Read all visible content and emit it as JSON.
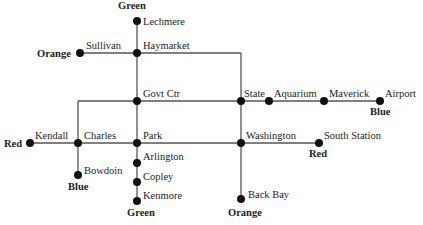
{
  "diagram": {
    "type": "subway-map",
    "colors": {
      "background": "#ffffff",
      "line": "#555555",
      "stop": "#111111",
      "text": "#222222"
    },
    "line_end_labels": [
      {
        "id": "green-north",
        "text": "Green",
        "x": 118,
        "y": 9
      },
      {
        "id": "orange-north",
        "text": "Orange",
        "x": 37,
        "y": 57
      },
      {
        "id": "blue-east",
        "text": "Blue",
        "x": 370,
        "y": 115
      },
      {
        "id": "red-west",
        "text": "Red",
        "x": 4,
        "y": 147
      },
      {
        "id": "red-east",
        "text": "Red",
        "x": 309,
        "y": 157
      },
      {
        "id": "blue-west",
        "text": "Blue",
        "x": 68,
        "y": 190
      },
      {
        "id": "green-south",
        "text": "Green",
        "x": 127,
        "y": 216
      },
      {
        "id": "orange-south",
        "text": "Orange",
        "x": 228,
        "y": 216
      }
    ],
    "stations": [
      {
        "id": "lechmere",
        "name": "Lechmere",
        "x": 137,
        "y": 21,
        "lx": 143,
        "ly": 25
      },
      {
        "id": "sullivan",
        "name": "Sullivan",
        "x": 80,
        "y": 53,
        "lx": 86,
        "ly": 49
      },
      {
        "id": "haymarket",
        "name": "Haymarket",
        "x": 137,
        "y": 53,
        "lx": 143,
        "ly": 49
      },
      {
        "id": "govt-ctr",
        "name": "Govt Ctr",
        "x": 137,
        "y": 101,
        "lx": 143,
        "ly": 97
      },
      {
        "id": "state",
        "name": "State",
        "x": 241,
        "y": 101,
        "lx": 244,
        "ly": 97
      },
      {
        "id": "aquarium",
        "name": "Aquarium",
        "x": 269,
        "y": 101,
        "lx": 274,
        "ly": 97
      },
      {
        "id": "maverick",
        "name": "Maverick",
        "x": 324,
        "y": 101,
        "lx": 329,
        "ly": 97
      },
      {
        "id": "airport",
        "name": "Airport",
        "x": 380,
        "y": 101,
        "lx": 385,
        "ly": 97
      },
      {
        "id": "kendall",
        "name": "Kendall",
        "x": 30,
        "y": 143,
        "lx": 35,
        "ly": 139
      },
      {
        "id": "charles",
        "name": "Charles",
        "x": 78,
        "y": 143,
        "lx": 84,
        "ly": 139
      },
      {
        "id": "park",
        "name": "Park",
        "x": 137,
        "y": 143,
        "lx": 143,
        "ly": 139
      },
      {
        "id": "washington",
        "name": "Washington",
        "x": 241,
        "y": 143,
        "lx": 246,
        "ly": 139
      },
      {
        "id": "south-station",
        "name": "South Station",
        "x": 319,
        "y": 143,
        "lx": 324,
        "ly": 139
      },
      {
        "id": "bowdoin",
        "name": "Bowdoin",
        "x": 78,
        "y": 175,
        "lx": 84,
        "ly": 174
      },
      {
        "id": "arlington",
        "name": "Arlington",
        "x": 137,
        "y": 163,
        "lx": 143,
        "ly": 160
      },
      {
        "id": "copley",
        "name": "Copley",
        "x": 137,
        "y": 182,
        "lx": 143,
        "ly": 180
      },
      {
        "id": "kenmore",
        "name": "Kenmore",
        "x": 137,
        "y": 201,
        "lx": 143,
        "ly": 199
      },
      {
        "id": "back-bay",
        "name": "Back Bay",
        "x": 241,
        "y": 199,
        "lx": 248,
        "ly": 198
      }
    ],
    "segments": [
      {
        "id": "green-main",
        "x1": 137,
        "y1": 21,
        "x2": 137,
        "y2": 201
      },
      {
        "id": "orange-top",
        "x1": 80,
        "y1": 53,
        "x2": 241,
        "y2": 53
      },
      {
        "id": "orange-main",
        "x1": 241,
        "y1": 53,
        "x2": 241,
        "y2": 199
      },
      {
        "id": "blue-main",
        "x1": 78,
        "y1": 101,
        "x2": 380,
        "y2": 101
      },
      {
        "id": "blue-west-drop",
        "x1": 78,
        "y1": 101,
        "x2": 78,
        "y2": 175
      },
      {
        "id": "red-main",
        "x1": 30,
        "y1": 143,
        "x2": 319,
        "y2": 143
      }
    ]
  }
}
